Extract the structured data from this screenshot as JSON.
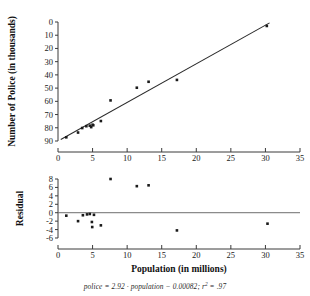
{
  "figure": {
    "caption": "police = 2.92 · population − 0.00082; r2 = .97",
    "caption_parts": {
      "lhs": "police",
      "eq1": " = ",
      "slope": "2.92",
      "dot": " · ",
      "xvar": "population",
      "minus": " − ",
      "intercept": "0.00082",
      "semi": "; ",
      "rsym": "r",
      "rsup": "2",
      "eq2": " = ",
      "rvalue": ".97"
    }
  },
  "chart_data": [
    {
      "type": "scatter",
      "name": "police-vs-population-scatter",
      "title": "",
      "xlabel": "",
      "ylabel": "Number of Police (in thousands)",
      "xlim": [
        0,
        35
      ],
      "ylim": [
        0,
        90
      ],
      "xticks": [
        0,
        5,
        10,
        15,
        20,
        25,
        30,
        35
      ],
      "yticks": [
        0,
        10,
        20,
        30,
        40,
        50,
        60,
        70,
        80,
        90
      ],
      "xticklabels": [
        "0",
        "5",
        "10",
        "15",
        "20",
        "25",
        "30",
        "35"
      ],
      "yticklabels": [
        "0",
        "10",
        "20",
        "30",
        "40",
        "50",
        "60",
        "70",
        "80",
        "90"
      ],
      "grid": false,
      "legend": "none",
      "points": [
        {
          "x": 1.2,
          "y": 2.8
        },
        {
          "x": 2.9,
          "y": 6.4
        },
        {
          "x": 3.5,
          "y": 9.8
        },
        {
          "x": 4.1,
          "y": 11.2
        },
        {
          "x": 4.6,
          "y": 11.6
        },
        {
          "x": 4.8,
          "y": 10.5
        },
        {
          "x": 5.0,
          "y": 12.3
        },
        {
          "x": 5.1,
          "y": 11.9
        },
        {
          "x": 6.2,
          "y": 15.1
        },
        {
          "x": 7.6,
          "y": 30.7
        },
        {
          "x": 11.4,
          "y": 40.3
        },
        {
          "x": 13.1,
          "y": 44.8
        },
        {
          "x": 17.2,
          "y": 46.2
        },
        {
          "x": 30.2,
          "y": 87.0
        }
      ],
      "fit_line": {
        "name": "least-squares-line",
        "slope": 2.92,
        "intercept": -0.00082,
        "x_start": 0.4,
        "x_end": 30.6
      }
    },
    {
      "type": "scatter",
      "name": "residual-plot",
      "title": "",
      "xlabel": "Population (in millions)",
      "ylabel": "Residual",
      "xlim": [
        0,
        35
      ],
      "ylim": [
        -6,
        8
      ],
      "xticks": [
        0,
        5,
        10,
        15,
        20,
        25,
        30,
        35
      ],
      "yticks": [
        -6,
        -4,
        -2,
        0,
        2,
        4,
        6,
        8
      ],
      "xticklabels": [
        "0",
        "5",
        "10",
        "15",
        "20",
        "25",
        "30",
        "35"
      ],
      "yticklabels": [
        "8",
        "6",
        "4",
        "2",
        "0",
        "-2",
        "-4",
        "-6"
      ],
      "grid": false,
      "legend": "none",
      "zero_line": 0,
      "points": [
        {
          "x": 1.2,
          "y": -0.7
        },
        {
          "x": 2.9,
          "y": -2.0
        },
        {
          "x": 3.6,
          "y": -0.6
        },
        {
          "x": 4.2,
          "y": -0.4
        },
        {
          "x": 4.6,
          "y": -0.3
        },
        {
          "x": 4.9,
          "y": -2.2
        },
        {
          "x": 4.95,
          "y": -3.4
        },
        {
          "x": 5.2,
          "y": -0.5
        },
        {
          "x": 6.2,
          "y": -3.0
        },
        {
          "x": 7.6,
          "y": 8.0
        },
        {
          "x": 11.4,
          "y": 6.3
        },
        {
          "x": 13.1,
          "y": 6.5
        },
        {
          "x": 17.2,
          "y": -4.2
        },
        {
          "x": 30.3,
          "y": -2.6
        }
      ]
    }
  ]
}
